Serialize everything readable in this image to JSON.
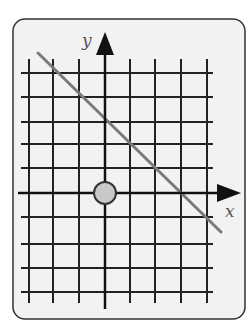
{
  "diagram": {
    "type": "coordinate-grid",
    "frame": {
      "x": 13,
      "y": 19,
      "width": 232,
      "height": 300,
      "radius": 12,
      "fill": "#f2f2f2",
      "stroke": "#333333"
    },
    "grid": {
      "vertical_x": [
        29,
        53,
        79,
        130,
        155,
        181,
        207
      ],
      "vertical_top": 59,
      "vertical_bottom": 303,
      "horizontal_y": [
        73,
        97,
        122,
        144,
        168,
        217,
        244,
        268,
        292
      ],
      "horizontal_left": 21,
      "horizontal_right": 213,
      "color": "#222222"
    },
    "axes": {
      "x_axis": {
        "y": 193,
        "x_start": 18,
        "arrow_base": 217,
        "arrow_tip": 241,
        "label": "x",
        "label_pos": [
          225,
          217
        ]
      },
      "y_axis": {
        "x": 105,
        "y_bottom": 309,
        "arrow_base": 55,
        "arrow_tip": 32,
        "label": "y",
        "label_pos": [
          82,
          46
        ]
      }
    },
    "line": {
      "x1": 38,
      "y1": 53,
      "x2": 221,
      "y2": 232,
      "color": "#7a7a7a",
      "width": 3
    },
    "point": {
      "cx": 105,
      "cy": 193,
      "r": 11,
      "fill": "#c8c8c8",
      "stroke": "#333333"
    }
  }
}
